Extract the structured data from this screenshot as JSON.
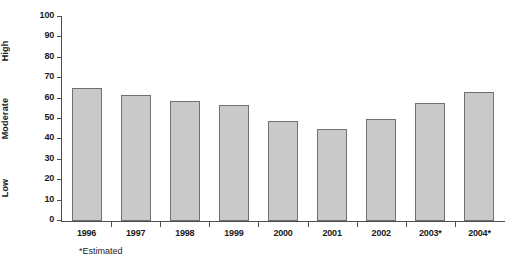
{
  "chart_data": {
    "type": "bar",
    "title": "",
    "xlabel": "",
    "ylabel": "",
    "categories": [
      "1996",
      "1997",
      "1998",
      "1999",
      "2000",
      "2001",
      "2002",
      "2003*",
      "2004*"
    ],
    "values": [
      65,
      62,
      59,
      57,
      49,
      45,
      50,
      58,
      63
    ],
    "ylim": [
      0,
      100
    ],
    "ytick_values": [
      0,
      10,
      20,
      30,
      40,
      50,
      60,
      70,
      80,
      90,
      100
    ],
    "ytick_labels": [
      "0",
      "10",
      "20",
      "30",
      "40",
      "50",
      "60",
      "70",
      "80",
      "90",
      "100"
    ],
    "zone_labels": [
      {
        "text": "Low",
        "range": [
          0,
          33
        ]
      },
      {
        "text": "Moderate",
        "range": [
          33,
          67
        ]
      },
      {
        "text": "High",
        "range": [
          67,
          100
        ]
      }
    ],
    "grid": false,
    "legend": false,
    "bar_color": "#c9c9c9",
    "bar_border_color": "#707070",
    "axis_color": "#4d4d4d",
    "footnote": "*Estimated"
  }
}
